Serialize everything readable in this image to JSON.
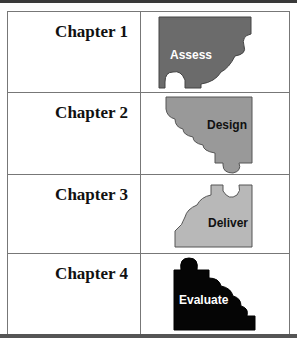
{
  "rows": [
    {
      "chapter": "Chapter 1",
      "piece_label": "Assess",
      "piece_color": "#6b6b6b",
      "label_color": "#ffffff"
    },
    {
      "chapter": "Chapter 2",
      "piece_label": "Design",
      "piece_color": "#999999",
      "label_color": "#111111"
    },
    {
      "chapter": "Chapter 3",
      "piece_label": "Deliver",
      "piece_color": "#b8b8b8",
      "label_color": "#111111"
    },
    {
      "chapter": "Chapter 4",
      "piece_label": "Evaluate",
      "piece_color": "#050505",
      "label_color": "#ffffff"
    }
  ]
}
